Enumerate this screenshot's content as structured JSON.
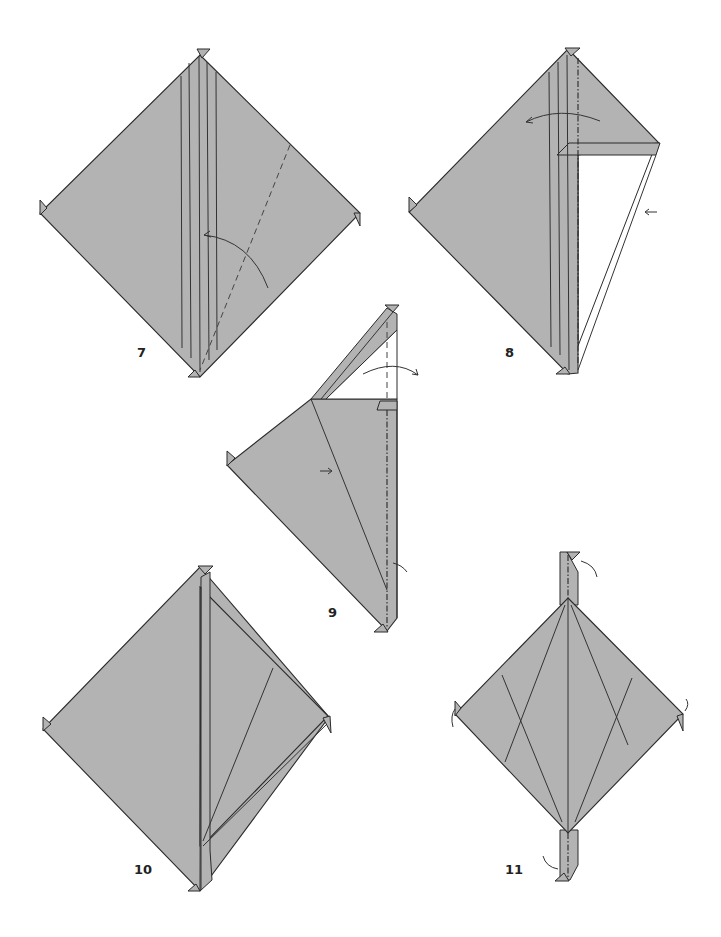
{
  "page": {
    "type": "origami-instruction-diagrams",
    "background": "#ffffff",
    "paper_color": "#b3b3b3",
    "line_color": "#2b2b2b"
  },
  "steps": [
    {
      "number": "7",
      "description": "Square with vertical crease lines and diagonal valley fold, arrow folding right edge to center"
    },
    {
      "number": "8",
      "description": "Right flap partially folded showing white reverse, mountain-fold line on center, arrow curving left"
    },
    {
      "number": "9",
      "description": "Narrow strip on top folded diagonally, valley line, arrows indicating unfolding"
    },
    {
      "number": "10",
      "description": "Square with central vertical line and angled crease on right half"
    },
    {
      "number": "11",
      "description": "Diamond with vertical strips top and bottom, crossing crease lines, arrows at corners"
    }
  ],
  "labels": {
    "step7": "7",
    "step8": "8",
    "step9": "9",
    "step10": "10",
    "step11": "11"
  }
}
